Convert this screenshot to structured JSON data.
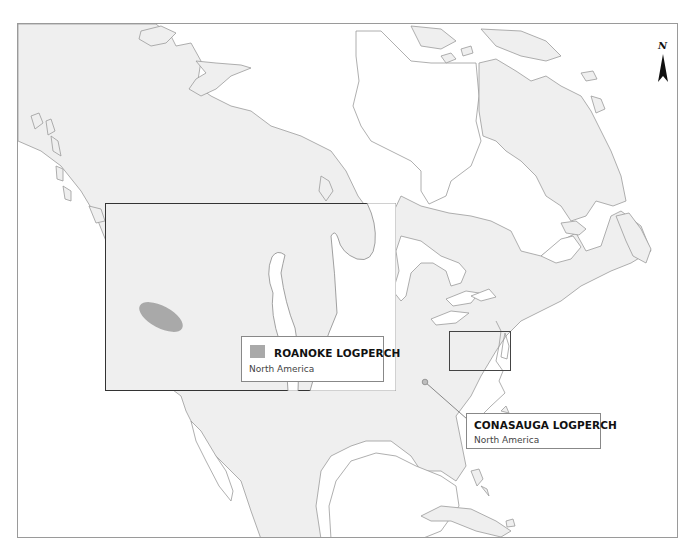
{
  "map": {
    "region": "North America",
    "north_arrow": {
      "label": "N",
      "icon": "north-arrow-icon"
    },
    "colors": {
      "land": "#efefef",
      "water": "#ffffff",
      "coastline": "#9a9a9a",
      "range_fill": "#a9a9a9",
      "frame": "#9a9a9a",
      "inset_border": "#333333"
    }
  },
  "legend": {
    "roanoke": {
      "title": "ROANOKE LOGPERCH",
      "subtitle": "North America",
      "swatch_color": "#a9a9a9"
    },
    "conasauga": {
      "title": "CONASAUGA LOGPERCH",
      "subtitle": "North America",
      "marker_color": "#9a9a9a"
    }
  }
}
